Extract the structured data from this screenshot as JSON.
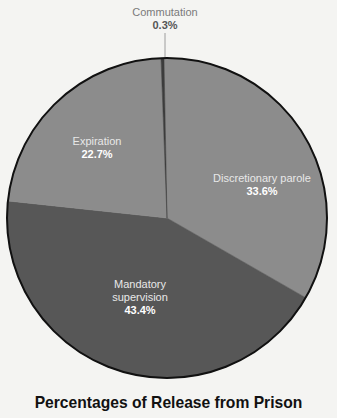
{
  "chart_data": {
    "type": "pie",
    "title": "Percentages of Release from Prison",
    "start_angle_deg": -1.08,
    "direction": "clockwise",
    "slices": [
      {
        "label": "Discretionary parole",
        "value": 33.6,
        "display": "33.6%",
        "color": "#8c8c8c"
      },
      {
        "label": "Mandatory supervision",
        "value": 43.4,
        "display": "43.4%",
        "color": "#575757"
      },
      {
        "label": "Expiration",
        "value": 22.7,
        "display": "22.7%",
        "color": "#8c8c8c"
      },
      {
        "label": "Commutation",
        "value": 0.3,
        "display": "0.3%",
        "color": "#3c3c3c"
      }
    ],
    "legend": "none (inline labels)"
  },
  "labels": {
    "commutation": {
      "name": "Commutation",
      "pct": "0.3%"
    },
    "expiration": {
      "name": "Expiration",
      "pct": "22.7%"
    },
    "discretionary": {
      "name": "Discretionary parole",
      "pct": "33.6%"
    },
    "mandatory": {
      "name_line1": "Mandatory",
      "name_line2": "supervision",
      "pct": "43.4%"
    }
  },
  "title": "Percentages of Release from Prison"
}
